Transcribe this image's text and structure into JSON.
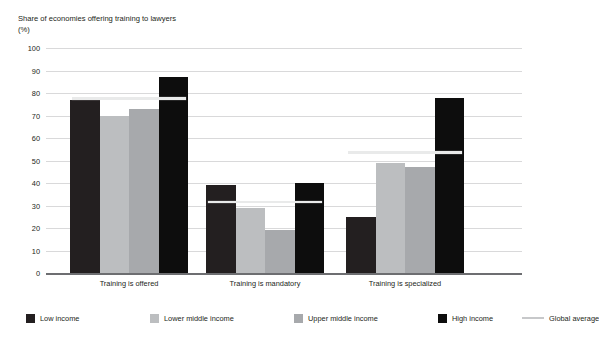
{
  "figure": {
    "title_remnant": "",
    "axis_title": "Share of economies offering training to lawyers",
    "axis_unit": "(%)"
  },
  "chart_data": {
    "type": "bar",
    "title": "Share of economies offering training to lawyers",
    "xlabel": "",
    "ylabel": "Share of economies offering training to lawyers (%)",
    "ylim": [
      0,
      100
    ],
    "yticks": [
      0,
      10,
      20,
      30,
      40,
      50,
      60,
      70,
      80,
      90,
      100
    ],
    "grid": true,
    "legend_position": "bottom",
    "categories": [
      "Training is offered",
      "Training is mandatory",
      "Training is specialized"
    ],
    "series": [
      {
        "name": "Low income",
        "color": "#231f20",
        "values": [
          77,
          39,
          25
        ]
      },
      {
        "name": "Lower middle income",
        "color": "#bcbec0",
        "values": [
          70,
          29,
          49
        ]
      },
      {
        "name": "Upper middle income",
        "color": "#a7a9ac",
        "values": [
          73,
          19,
          47
        ]
      },
      {
        "name": "High income",
        "color": "#0d0d0d",
        "values": [
          87,
          40,
          78
        ]
      }
    ],
    "overlay": {
      "name": "Global average",
      "color": "#e9eaea",
      "legend_color": "#c7c8ca",
      "values": [
        77,
        31,
        53
      ]
    }
  },
  "legend": {
    "items": [
      {
        "label": "Low income",
        "color": "#231f20",
        "marker": "square"
      },
      {
        "label": "Lower middle income",
        "color": "#bcbec0",
        "marker": "square"
      },
      {
        "label": "Upper middle income",
        "color": "#a7a9ac",
        "marker": "square"
      },
      {
        "label": "High income",
        "color": "#0d0d0d",
        "marker": "square"
      },
      {
        "label": "Global average",
        "color": "#c7c8ca",
        "marker": "line"
      }
    ]
  }
}
